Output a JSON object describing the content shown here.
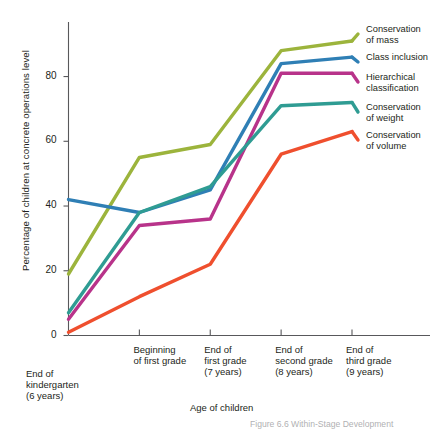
{
  "chart_data": {
    "type": "line",
    "title": "",
    "xlabel": "Age of children",
    "ylabel": "Percentage of children at concrete operations level",
    "categories": [
      "End of\nkindergarten\n(6 years)",
      "Beginning\nof first grade",
      "End of\nfirst grade\n(7 years)",
      "End of\nsecond grade\n(8 years)",
      "End of\nthird grade\n(9 years)"
    ],
    "x": [
      0,
      1,
      2,
      3,
      4
    ],
    "ylim": [
      0,
      95
    ],
    "xlim": [
      0,
      4
    ],
    "yticks": [
      0,
      20,
      40,
      60,
      80
    ],
    "grid": false,
    "legend_position": "right",
    "series": [
      {
        "name": "Conservation\nof mass",
        "label_line1": "Conservation",
        "label_line2": "of mass",
        "color": "#9cb43c",
        "values": [
          19,
          55,
          59,
          88,
          91
        ]
      },
      {
        "name": "Class inclusion",
        "label_line1": "Class inclusion",
        "label_line2": "",
        "color": "#2f7fb5",
        "values": [
          42,
          38,
          45,
          84,
          86
        ]
      },
      {
        "name": "Hierarchical\nclassification",
        "label_line1": "Hierarchical",
        "label_line2": "classification",
        "color": "#b8338a",
        "values": [
          5,
          34,
          36,
          81,
          81
        ]
      },
      {
        "name": "Conservation\nof weight",
        "label_line1": "Conservation",
        "label_line2": "of weight",
        "color": "#2f9c93",
        "values": [
          7,
          38,
          46,
          71,
          72
        ]
      },
      {
        "name": "Conservation\nof volume",
        "label_line1": "Conservation",
        "label_line2": "of volume",
        "color": "#ef4f2e",
        "values": [
          1,
          12,
          22,
          56,
          63
        ]
      }
    ]
  },
  "axes": {
    "y_tick_labels": [
      "0",
      "20",
      "40",
      "60",
      "80"
    ],
    "x_tick_labels": [
      "End of\nkindergarten\n(6 years)",
      "Beginning\nof first grade",
      "End of\nfirst grade\n(7 years)",
      "End of\nsecond grade\n(8 years)",
      "End of\nthird grade\n(9 years)"
    ],
    "x_axis_title": "Age of children",
    "y_axis_title": "Percentage of children at concrete operations level"
  },
  "legend": {
    "items": [
      "Conservation\nof mass",
      "Class inclusion",
      "Hierarchical\nclassification",
      "Conservation\nof weight",
      "Conservation\nof volume"
    ]
  },
  "caption": {
    "text": "Figure 6.6  Within-Stage Development"
  }
}
